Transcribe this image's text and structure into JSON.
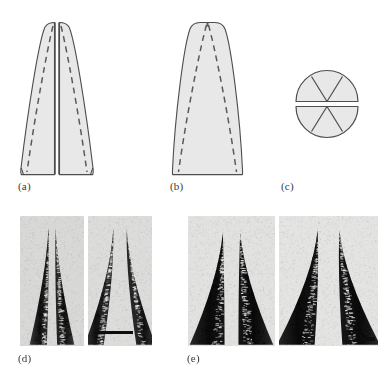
{
  "figure": {
    "kind": "scientific-figure-plate",
    "width": 390,
    "height": 383,
    "background": "#ffffff"
  },
  "panels": [
    {
      "id": "a",
      "label": "(a)",
      "label_x": 18,
      "label_y": 180,
      "type": "schematic-cross-section",
      "description": "Tapered blade outline split lengthwise by a central vertical slot, with dashed internal V lines",
      "fill": "#e8e8e8",
      "stroke": "#4d4d4d",
      "dashed_stroke": "#5a5a5a",
      "has_center_split": true,
      "has_dashed_vees": true,
      "bounds": {
        "x": 20,
        "y": 22,
        "w": 93,
        "h": 153
      }
    },
    {
      "id": "b",
      "label": "(b)",
      "label_x": 170,
      "label_y": 180,
      "type": "schematic-cross-section",
      "description": "Tapered blade outline without central slot, with dashed internal V lines",
      "fill": "#e8e8e8",
      "stroke": "#4d4d4d",
      "dashed_stroke": "#5a5a5a",
      "has_center_split": false,
      "has_dashed_vees": true,
      "bounds": {
        "x": 172,
        "y": 22,
        "w": 71,
        "h": 153
      }
    },
    {
      "id": "c",
      "label": "(c)",
      "label_x": 281,
      "label_y": 180,
      "type": "schematic-end-view",
      "description": "Circular end view divided by a horizontal slot into two halves, each half split into three wedges by V lines meeting at the centre",
      "fill": "#e8e8e8",
      "stroke": "#4d4d4d",
      "center_x": 327,
      "center_y": 104,
      "radius": 31,
      "slot_half_height": 2.5,
      "wedges_per_half": 3
    },
    {
      "id": "d",
      "label": "(d)",
      "label_x": 18,
      "label_y": 352,
      "type": "micrograph-group",
      "description": "Two light-field micrographs of split needle tips",
      "images": [
        {
          "name": "micrograph-d1",
          "x": 20,
          "y": 216,
          "w": 64,
          "h": 130,
          "tone": "light",
          "background": "#d8d8d6",
          "tip_count": 2,
          "tip_style": "slender-long-taper",
          "scalebar": null
        },
        {
          "name": "micrograph-d2",
          "x": 88,
          "y": 216,
          "w": 64,
          "h": 130,
          "tone": "light",
          "background": "#dcdcda",
          "tip_count": 2,
          "tip_style": "slender-long-taper-splayed",
          "scalebar": {
            "x": 97,
            "y": 331,
            "w": 36,
            "h": 3,
            "color": "#0d0d0d"
          }
        }
      ]
    },
    {
      "id": "e",
      "label": "(e)",
      "label_x": 187,
      "label_y": 352,
      "type": "micrograph-group",
      "description": "Two high-contrast micrographs of split needle tips",
      "images": [
        {
          "name": "micrograph-e1",
          "x": 188,
          "y": 216,
          "w": 87,
          "h": 130,
          "tone": "dark",
          "background": "#e2e2e0",
          "tip_count": 2,
          "tip_style": "broad-blunt-taper",
          "scalebar": null
        },
        {
          "name": "micrograph-e2",
          "x": 279,
          "y": 216,
          "w": 99,
          "h": 130,
          "tone": "dark",
          "background": "#e4e4e2",
          "tip_count": 2,
          "tip_style": "broad-sharp-taper",
          "scalebar": {
            "x": 360,
            "y": 337,
            "w": 15,
            "h": 4,
            "color": "#0d0d0d"
          }
        }
      ]
    }
  ],
  "labels": {
    "a": "(a)",
    "b": "(b)",
    "c": "(c)",
    "d": "(d)",
    "e": "(e)"
  },
  "colors": {
    "schematic_fill": "#e8e8e8",
    "schematic_stroke": "#4d4d4d",
    "dashed_stroke": "#5a5a5a",
    "label_text": "#3a3a3a",
    "scalebar": "#0d0d0d",
    "page_background": "#ffffff"
  }
}
